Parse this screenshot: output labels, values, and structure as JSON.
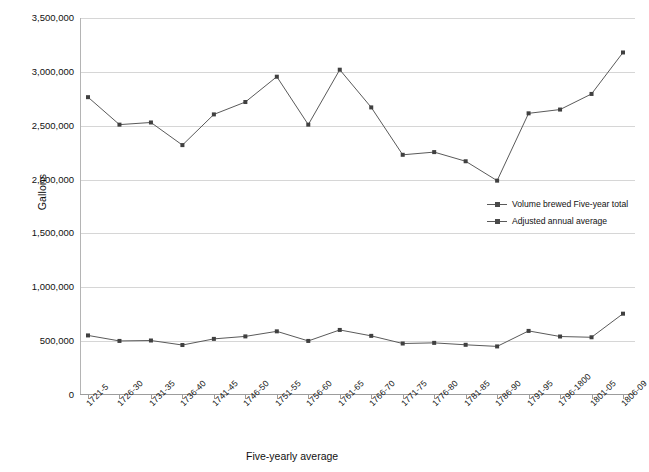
{
  "chart_data": {
    "type": "line",
    "title": "",
    "xlabel": "Five-yearly average",
    "ylabel": "Gallons",
    "ylim": [
      0,
      3500000
    ],
    "ytick_step": 500000,
    "grid": true,
    "legend_position": "center-right",
    "categories": [
      "1721-5",
      "1726-30",
      "1731-35",
      "1736-40",
      "1741-45",
      "1746-50",
      "1751-55",
      "1756-60",
      "1761-65",
      "1766-70",
      "1771-75",
      "1776-80",
      "1781-85",
      "1786-90",
      "1791-95",
      "1796-1800",
      "1801-05",
      "1806-09"
    ],
    "ytick_labels": [
      "0",
      "500,000",
      "1,000,000",
      "1,500,000",
      "2,000,000",
      "2,500,000",
      "3,000,000",
      "3,500,000"
    ],
    "ytick_values": [
      0,
      500000,
      1000000,
      1500000,
      2000000,
      2500000,
      3000000,
      3500000
    ],
    "series": [
      {
        "name": "Volume brewed Five-year total",
        "color": "#5a5a5a",
        "marker_color": "#404040",
        "values": [
          2765000,
          2510000,
          2530000,
          2320000,
          2605000,
          2720000,
          2955000,
          2510000,
          3020000,
          2670000,
          2230000,
          2255000,
          2170000,
          1990000,
          2615000,
          2650000,
          2795000,
          3180000
        ]
      },
      {
        "name": "Adjusted annual average",
        "color": "#5a5a5a",
        "marker_color": "#404040",
        "values": [
          553000,
          502000,
          506000,
          464000,
          521000,
          544000,
          591000,
          502000,
          604000,
          549000,
          478000,
          484000,
          466000,
          451000,
          595000,
          543000,
          536000,
          755000
        ]
      }
    ]
  },
  "legend": {
    "items": [
      {
        "label": "Volume brewed Five-year total"
      },
      {
        "label": "Adjusted annual average"
      }
    ]
  },
  "axes": {
    "y_title": "Gallons",
    "x_title": "Five-yearly average"
  }
}
